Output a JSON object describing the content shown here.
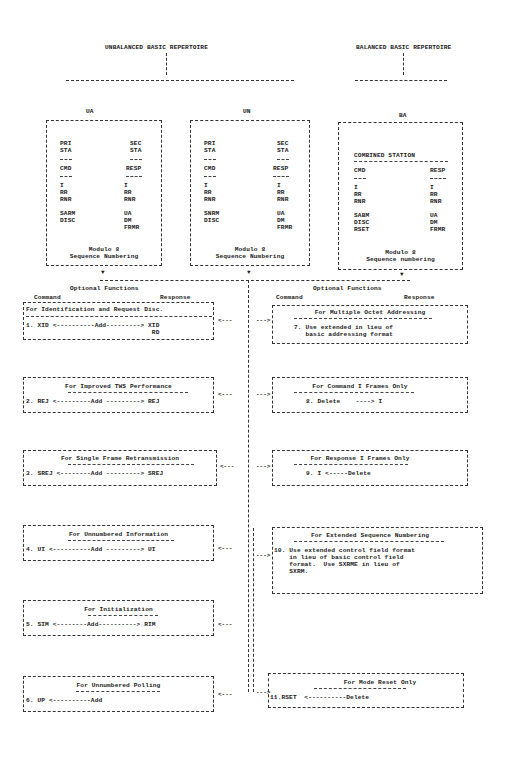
{
  "headers": {
    "unbalanced": "UNBALANCED BASIC REPERTOIRE",
    "balanced": "BALANCED BASIC REPERTOIRE"
  },
  "classes": [
    {
      "label": "UA",
      "primary_label": "PRI\nSTA",
      "secondary_label": "SEC\nSTA",
      "cmd_label": "CMD",
      "resp_label": "RESP",
      "cmd_frames": "I\nRR\nRNR\n\nSARM\nDISC",
      "resp_frames": "I\nRR\nRNR\n\nUA\nDM\nFRMR",
      "footer": "Modulo 8\nSequence Numbering"
    },
    {
      "label": "UN",
      "primary_label": "PRI\nSTA",
      "secondary_label": "SEC\nSTA",
      "cmd_label": "CMD",
      "resp_label": "RESP",
      "cmd_frames": "I\nRR\nRNR\n\nSNRM\nDISC",
      "resp_frames": "I\nRR\nRNR\n\nUA\nDM\nFRMR",
      "footer": "Modulo 8\nSequence Numbering"
    },
    {
      "label": "BA",
      "station_label": "COMBINED STATION",
      "cmd_label": "CMD",
      "resp_label": "RESP",
      "cmd_frames": "I\nRR\nRNR\n\nSABM\nDISC\nRSET",
      "resp_frames": "I\nRR\nRNR\n\nUA\nDM\nFRMR",
      "footer": "Modulo 8\nSequence numbering"
    }
  ],
  "optional_left": {
    "title": "Optional Functions",
    "command": "Command",
    "response": "Response"
  },
  "optional_right": {
    "title": "Optional Functions",
    "command": "Command",
    "response": "Response"
  },
  "left_options": [
    {
      "title": "For Identification and Request Disc.",
      "body": "1. XID <----------Add---------> XID\n                                 RD"
    },
    {
      "title": "For Improved TWS Performance",
      "body": "2. REJ <---------Add ---------> REJ"
    },
    {
      "title": "For Single Frame Retransmission",
      "body": "3. SREJ <--------Add ---------> SREJ"
    },
    {
      "title": "For Unnumbered Information",
      "body": "4. UI <----------Add ---------> UI"
    },
    {
      "title": "For Initialization",
      "body": "5. SIM <--------Add----------> RIM"
    },
    {
      "title": "For Unnumbered Polling",
      "body": "6. UP <----------Add"
    }
  ],
  "right_options": [
    {
      "title": "For Multiple Octet Addressing",
      "body": "7. Use extended in lieu of\n   basic addressing format"
    },
    {
      "title": "For Command I Frames Only",
      "body": "8. Delete    ----> I"
    },
    {
      "title": "For Response I Frames Only",
      "body": "9. I <-----Delete"
    },
    {
      "title": "For Extended Sequence Numbering",
      "body": "10. Use extended control field format\n    in lieu of basic control field\n    format.  Use SXRME in lieu of\n    SXRM."
    },
    {
      "title": "For Mode Reset Only",
      "body": "11.RSET  <----------Delete"
    }
  ],
  "arrows": {
    "down": "▼",
    "left": "<---",
    "right": "--->"
  }
}
